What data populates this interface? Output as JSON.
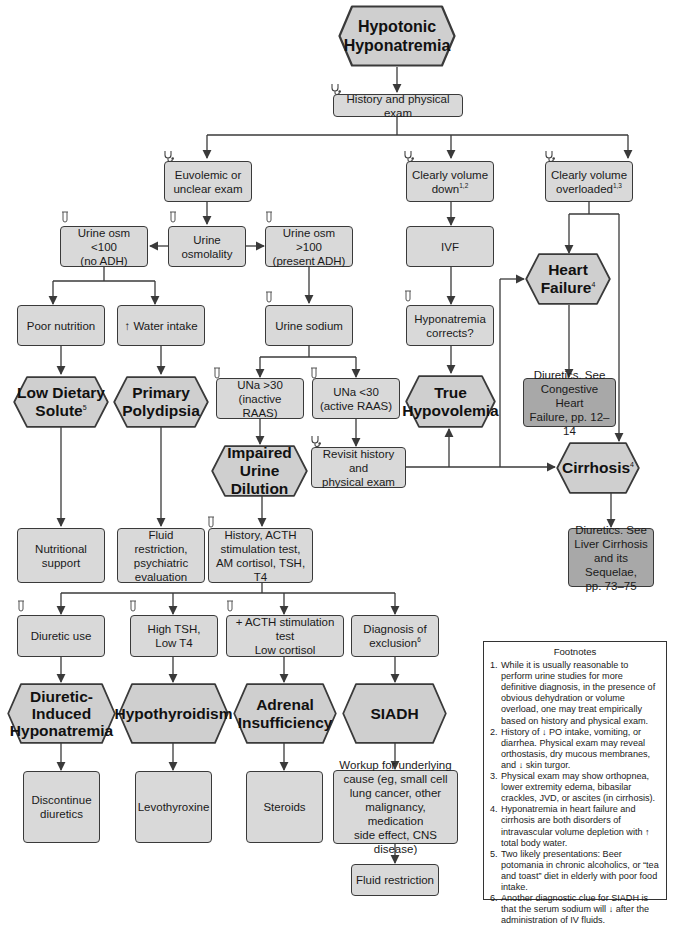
{
  "diagram": {
    "title_lines": [
      "Hypotonic",
      "Hyponatremia"
    ],
    "icons": {
      "exam": "stethoscope-icon",
      "lab": "test-tube-icon"
    },
    "nodes": {
      "history_exam": "History and physical exam",
      "euvolemic": [
        "Euvolemic or",
        "unclear exam"
      ],
      "volume_down": {
        "text": [
          "Clearly volume",
          "down"
        ],
        "sup": "1,2"
      },
      "volume_overloaded": {
        "text": [
          "Clearly volume",
          "overloaded"
        ],
        "sup": "1,3"
      },
      "urine_osmolality": [
        "Urine",
        "osmolality"
      ],
      "urine_osm_low": [
        "Urine osm <100",
        "(no ADH)"
      ],
      "urine_osm_high": [
        "Urine osm >100",
        "(present ADH)"
      ],
      "ivf": "IVF",
      "hyponatremia_corrects": [
        "Hyponatremia",
        "corrects?"
      ],
      "heart_failure": {
        "text": [
          "Heart",
          "Failure"
        ],
        "sup": "4"
      },
      "poor_nutrition": "Poor nutrition",
      "water_intake": "↑ Water intake",
      "urine_sodium": "Urine sodium",
      "low_dietary_solute": {
        "text": [
          "Low Dietary",
          "Solute"
        ],
        "sup": "5"
      },
      "primary_polydipsia": [
        "Primary",
        "Polydipsia"
      ],
      "una_high": [
        "UNa >30",
        "(inactive RAAS)"
      ],
      "una_low": [
        "UNa <30",
        "(active RAAS)"
      ],
      "true_hypovolemia": [
        "True",
        "Hypovolemia"
      ],
      "chf_treatment": [
        "Diuretics. See",
        "Congestive Heart",
        "Failure, pp. 12–14"
      ],
      "impaired_urine_dilution": [
        "Impaired",
        "Urine Dilution"
      ],
      "revisit_history": [
        "Revisit history and",
        "physical exam"
      ],
      "cirrhosis": {
        "text": "Cirrhosis",
        "sup": "4"
      },
      "cirrhosis_treatment": [
        "Diuretics. See",
        "Liver Cirrhosis",
        "and its Sequelae,",
        "pp. 73–75"
      ],
      "nutritional_support": [
        "Nutritional",
        "support"
      ],
      "fluid_restriction_psych": [
        "Fluid restriction,",
        "psychiatric",
        "evaluation"
      ],
      "workup_tests": [
        "History, ACTH",
        "stimulation test,",
        "AM cortisol, TSH, T4"
      ],
      "diuretic_use": "Diuretic use",
      "high_tsh": [
        "High TSH,",
        "Low T4"
      ],
      "acth_test": [
        "+ ACTH stimulation test",
        "Low cortisol"
      ],
      "diagnosis_exclusion": {
        "text": [
          "Diagnosis of",
          "exclusion"
        ],
        "sup": "6"
      },
      "diuretic_induced": [
        "Diuretic-",
        "Induced",
        "Hyponatremia"
      ],
      "hypothyroidism": "Hypothyroidism",
      "adrenal_insufficiency": [
        "Adrenal",
        "Insufficiency"
      ],
      "siadh": "SIADH",
      "discontinue_diuretics": [
        "Discontinue",
        "diuretics"
      ],
      "levothyroxine": "Levothyroxine",
      "steroids": "Steroids",
      "siadh_workup": [
        "Workup for underlying",
        "cause (eg, small cell",
        "lung cancer, other",
        "malignancy, medication",
        "side effect, CNS disease)"
      ],
      "fluid_restriction": "Fluid restriction"
    },
    "colors": {
      "box_fill": "#d9d9d9",
      "treatment_fill": "#a8a8a8",
      "stroke": "#3a3a3a",
      "background": "#ffffff"
    }
  },
  "footnotes": {
    "title": "Footnotes",
    "items": [
      "While it is usually reasonable to perform urine studies for more definitive diagnosis, in the presence of obvious dehydration or volume overload, one may treat empirically based on history and physical exam.",
      "History of ↓ PO intake, vomiting, or diarrhea. Physical exam may reveal orthostasis, dry mucous membranes, and ↓ skin turgor.",
      "Physical exam may show orthopnea, lower extremity edema, bibasilar crackles, JVD, or ascites (in cirrhosis).",
      "Hyponatremia in heart failure and cirrhosis are both disorders of intravascular volume depletion with ↑ total body water.",
      "Two likely presentations: Beer potomania in chronic alcoholics, or “tea and toast” diet in elderly with poor food intake.",
      "Another diagnostic clue for SIADH is that the serum sodium will ↓ after the administration of IV fluids."
    ]
  }
}
